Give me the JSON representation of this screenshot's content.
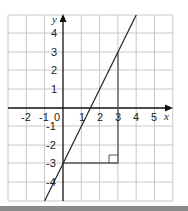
{
  "diagram": {
    "x_axis_label": "x",
    "y_axis_label": "y",
    "x_ticks": [
      "-2",
      "-1",
      "0",
      "1",
      "2",
      "3",
      "4",
      "5"
    ],
    "y_ticks": [
      "4",
      "3",
      "2",
      "1",
      "-1",
      "-2",
      "-3",
      "-4"
    ],
    "line": {
      "equation": "y = 2x - 3",
      "from": [
        -1,
        -5
      ],
      "to": [
        4,
        5
      ]
    },
    "triangle": {
      "vertices": [
        [
          0,
          -3
        ],
        [
          3,
          -3
        ],
        [
          3,
          3
        ]
      ],
      "right_angle_at": [
        3,
        -3
      ]
    },
    "grid": {
      "x_min": -3,
      "x_max": 6,
      "y_min": -5,
      "y_max": 5
    },
    "colors": {
      "grid": "#c8c8c8",
      "axis": "#111111",
      "line": "#222222",
      "triangle": "#555555"
    }
  }
}
